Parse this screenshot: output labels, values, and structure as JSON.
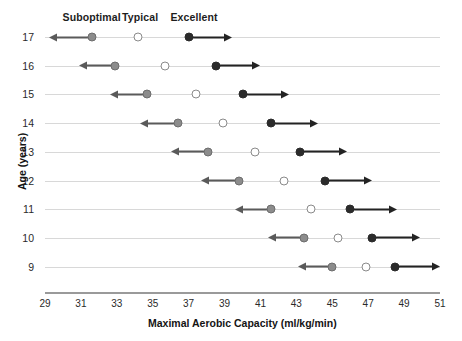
{
  "chart_data": {
    "type": "scatter",
    "title": "",
    "xlabel": "Maximal Aerobic Capacity (ml/kg/min)",
    "ylabel": "Age (years)",
    "xlim": [
      29,
      51
    ],
    "ylim": [
      8.5,
      17.5
    ],
    "grid": "horizontal-row-lines",
    "legend_position": "top",
    "xticks": [
      29,
      31,
      33,
      35,
      37,
      39,
      41,
      43,
      45,
      47,
      49,
      51
    ],
    "yticks": [
      17,
      16,
      15,
      14,
      13,
      12,
      11,
      10,
      9
    ],
    "legend": [
      {
        "name": "Suboptimal",
        "marker": "filled-gray-circle",
        "color": "#8c8c8c",
        "label_x": 31.6
      },
      {
        "name": "Typical",
        "marker": "open-circle",
        "color": "#ffffff",
        "label_x": 34.3
      },
      {
        "name": "Excellent",
        "marker": "filled-black-circle",
        "color": "#2b2b2b",
        "label_x": 37.3
      }
    ],
    "categories": [
      17,
      16,
      15,
      14,
      13,
      12,
      11,
      10,
      9
    ],
    "series": [
      {
        "name": "Suboptimal",
        "values": [
          31.6,
          32.9,
          34.7,
          36.4,
          38.1,
          39.8,
          41.6,
          43.4,
          45.0
        ]
      },
      {
        "name": "Typical",
        "values": [
          34.2,
          35.7,
          37.4,
          38.9,
          40.7,
          42.3,
          43.8,
          45.3,
          46.9
        ]
      },
      {
        "name": "Excellent",
        "values": [
          37.0,
          38.5,
          40.0,
          41.6,
          43.2,
          44.6,
          46.0,
          47.2,
          48.5
        ]
      }
    ],
    "annotations": [
      {
        "age": 17,
        "suboptimal_arrow_to": 29.2,
        "excellent_arrow_to": 39.4
      },
      {
        "age": 16,
        "suboptimal_arrow_to": 30.9,
        "excellent_arrow_to": 41.0
      },
      {
        "age": 15,
        "suboptimal_arrow_to": 32.6,
        "excellent_arrow_to": 42.6
      },
      {
        "age": 14,
        "suboptimal_arrow_to": 34.3,
        "excellent_arrow_to": 44.2
      },
      {
        "age": 13,
        "suboptimal_arrow_to": 36.0,
        "excellent_arrow_to": 45.8
      },
      {
        "age": 12,
        "suboptimal_arrow_to": 37.7,
        "excellent_arrow_to": 47.2
      },
      {
        "age": 11,
        "suboptimal_arrow_to": 39.6,
        "excellent_arrow_to": 48.6
      },
      {
        "age": 10,
        "suboptimal_arrow_to": 41.4,
        "excellent_arrow_to": 49.9
      },
      {
        "age": 9,
        "suboptimal_arrow_to": 43.1,
        "excellent_arrow_to": 51.0
      }
    ]
  }
}
